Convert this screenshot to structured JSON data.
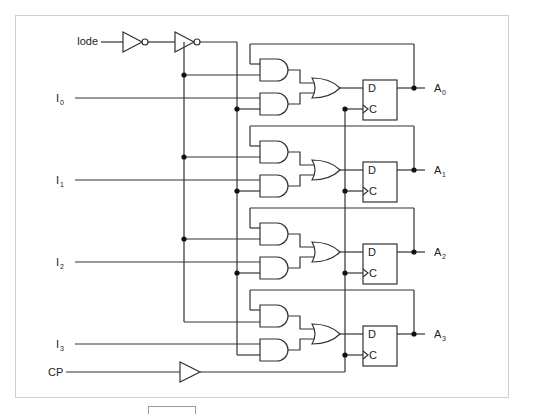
{
  "diagram": {
    "type": "logic-circuit",
    "inputs": {
      "load": {
        "label": "lode"
      },
      "data": [
        {
          "label": "I",
          "sub": "0"
        },
        {
          "label": "I",
          "sub": "1"
        },
        {
          "label": "I",
          "sub": "2"
        },
        {
          "label": "I",
          "sub": "3"
        }
      ],
      "clock": {
        "label": "CP"
      }
    },
    "outputs": [
      {
        "label": "A",
        "sub": "0"
      },
      {
        "label": "A",
        "sub": "1"
      },
      {
        "label": "A",
        "sub": "2"
      },
      {
        "label": "A",
        "sub": "3"
      }
    ],
    "flipflop": {
      "d_label": "D",
      "c_label": "C"
    },
    "components": [
      "2 inverters on load line",
      "8 AND gates",
      "4 OR gates",
      "4 D flip-flops",
      "1 clock buffer"
    ],
    "colors": {
      "wire": "#333333",
      "frame": "#cfcfcf",
      "background": "#ffffff"
    }
  }
}
